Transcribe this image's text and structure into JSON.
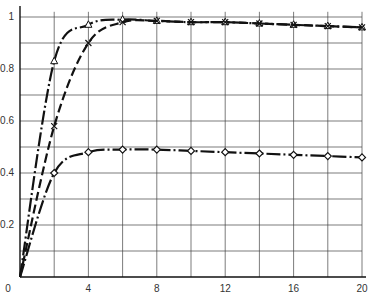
{
  "chart_data": {
    "type": "line",
    "title": "",
    "xlabel": "",
    "ylabel": "",
    "xlim": [
      0,
      20
    ],
    "ylim": [
      0,
      1.05
    ],
    "grid": true,
    "legend": "none",
    "x_ticks": [
      0,
      4,
      8,
      12,
      16,
      20
    ],
    "x_tick_labels": [
      "0",
      "4",
      "8",
      "12",
      "16",
      "20"
    ],
    "y_ticks": [
      0.2,
      0.4,
      0.6,
      0.8,
      1
    ],
    "y_tick_labels": [
      "0.2",
      "0.4",
      "0.6",
      "0.8",
      "1"
    ],
    "series": [
      {
        "name": "triangle",
        "marker": "triangle",
        "line_style": "dash-dot",
        "x": [
          0,
          2,
          4,
          6,
          8,
          10,
          12,
          14,
          16,
          18,
          20
        ],
        "values": [
          0,
          0.83,
          0.97,
          0.99,
          0.985,
          0.98,
          0.98,
          0.975,
          0.97,
          0.965,
          0.96
        ]
      },
      {
        "name": "cross",
        "marker": "x",
        "line_style": "dashed",
        "x": [
          0,
          2,
          4,
          6,
          8,
          10,
          12,
          14,
          16,
          18,
          20
        ],
        "values": [
          0,
          0.58,
          0.9,
          0.98,
          0.985,
          0.98,
          0.98,
          0.975,
          0.97,
          0.965,
          0.96
        ]
      },
      {
        "name": "diamond",
        "marker": "diamond",
        "line_style": "dash-dot",
        "x": [
          0,
          2,
          4,
          6,
          8,
          10,
          12,
          14,
          16,
          18,
          20
        ],
        "values": [
          0,
          0.4,
          0.48,
          0.49,
          0.49,
          0.485,
          0.48,
          0.475,
          0.47,
          0.465,
          0.46
        ]
      }
    ]
  },
  "colors": {
    "line": "#111111",
    "grid": "#444444",
    "background": "#ffffff"
  }
}
